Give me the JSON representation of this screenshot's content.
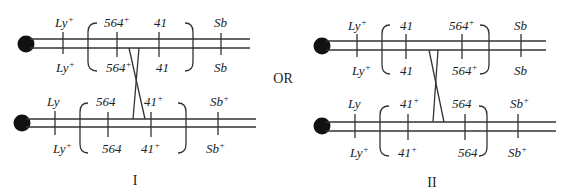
{
  "connector": "OR",
  "panels": [
    {
      "label": "I",
      "top_chromosome": {
        "above": [
          {
            "text": "Ly",
            "sup": "+"
          },
          {
            "text": "564",
            "sup": "+"
          },
          {
            "text": "41",
            "sup": ""
          },
          {
            "text": "Sb",
            "sup": ""
          }
        ],
        "below": [
          {
            "text": "Ly",
            "sup": "+"
          },
          {
            "text": "564",
            "sup": "+"
          },
          {
            "text": "41",
            "sup": ""
          },
          {
            "text": "Sb",
            "sup": ""
          }
        ]
      },
      "bottom_chromosome": {
        "above": [
          {
            "text": "Ly",
            "sup": ""
          },
          {
            "text": "564",
            "sup": ""
          },
          {
            "text": "41",
            "sup": "+"
          },
          {
            "text": "Sb",
            "sup": "+"
          }
        ],
        "below": [
          {
            "text": "Ly",
            "sup": "+"
          },
          {
            "text": "564",
            "sup": ""
          },
          {
            "text": "41",
            "sup": "+"
          },
          {
            "text": "Sb",
            "sup": "+"
          }
        ]
      }
    },
    {
      "label": "II",
      "top_chromosome": {
        "above": [
          {
            "text": "Ly",
            "sup": "+"
          },
          {
            "text": "41",
            "sup": ""
          },
          {
            "text": "564",
            "sup": "+"
          },
          {
            "text": "Sb",
            "sup": ""
          }
        ],
        "below": [
          {
            "text": "Ly",
            "sup": "+"
          },
          {
            "text": "41",
            "sup": ""
          },
          {
            "text": "564",
            "sup": "+"
          },
          {
            "text": "Sb",
            "sup": ""
          }
        ]
      },
      "bottom_chromosome": {
        "above": [
          {
            "text": "Ly",
            "sup": ""
          },
          {
            "text": "41",
            "sup": "+"
          },
          {
            "text": "564",
            "sup": ""
          },
          {
            "text": "Sb",
            "sup": "+"
          }
        ],
        "below": [
          {
            "text": "Ly",
            "sup": "+"
          },
          {
            "text": "41",
            "sup": "+"
          },
          {
            "text": "564",
            "sup": ""
          },
          {
            "text": "Sb",
            "sup": "+"
          }
        ]
      }
    }
  ]
}
